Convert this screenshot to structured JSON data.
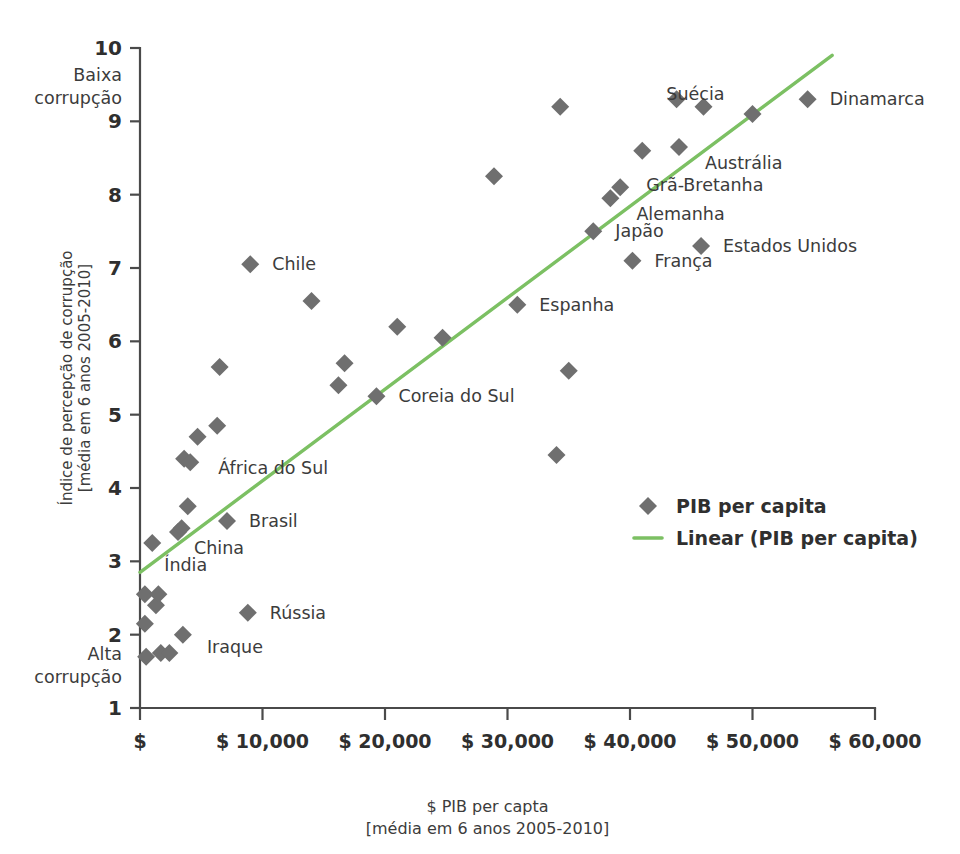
{
  "chart_data": {
    "type": "scatter",
    "title": "",
    "xlabel": "$ PIB per capta",
    "xlabel_sub": "[média em 6 anos 2005-2010]",
    "ylabel": "Índice de percepção de corrupção",
    "ylabel_sub": "[média em 6 anos 2005-2010]",
    "xlim": [
      0,
      60000
    ],
    "ylim": [
      1,
      10
    ],
    "grid": false,
    "legend_position": "middle-right",
    "xticks": [
      0,
      10000,
      20000,
      30000,
      40000,
      50000,
      60000
    ],
    "xtick_labels": [
      "$",
      "$ 10,000",
      "$ 20,000",
      "$ 30,000",
      "$ 40,000",
      "$ 50,000",
      "$ 60,000"
    ],
    "yticks": [
      1,
      2,
      3,
      4,
      5,
      6,
      7,
      8,
      9,
      10
    ],
    "ytick_labels": [
      "1",
      "2",
      "3",
      "4",
      "5",
      "6",
      "7",
      "8",
      "9",
      "10"
    ],
    "y_axis_top_note": "Baixa\ncorrupção",
    "y_axis_top_note_line1": "Baixa",
    "y_axis_top_note_line2": "corrupção",
    "y_axis_bottom_note_line1": "Alta",
    "y_axis_bottom_note_line2": "corrupção",
    "marker_color": "#6f6f6f",
    "line_color": "#7cc063",
    "axis_color": "#4a4a4a",
    "series": [
      {
        "name": "PIB per capita",
        "type": "scatter",
        "marker": "diamond",
        "color": "#6f6f6f",
        "points": [
          {
            "x": 400,
            "y": 2.55,
            "label": ""
          },
          {
            "x": 400,
            "y": 2.15,
            "label": ""
          },
          {
            "x": 500,
            "y": 1.7,
            "label": ""
          },
          {
            "x": 1000,
            "y": 3.25,
            "label": "Índia"
          },
          {
            "x": 1300,
            "y": 2.4,
            "label": ""
          },
          {
            "x": 1500,
            "y": 2.55,
            "label": ""
          },
          {
            "x": 1700,
            "y": 1.75,
            "label": ""
          },
          {
            "x": 2400,
            "y": 1.75,
            "label": ""
          },
          {
            "x": 3100,
            "y": 3.4,
            "label": "China"
          },
          {
            "x": 3400,
            "y": 3.45,
            "label": ""
          },
          {
            "x": 3500,
            "y": 2.0,
            "label": "Iraque"
          },
          {
            "x": 3600,
            "y": 4.4,
            "label": ""
          },
          {
            "x": 3900,
            "y": 3.75,
            "label": ""
          },
          {
            "x": 4100,
            "y": 4.35,
            "label": "África do Sul"
          },
          {
            "x": 4700,
            "y": 4.7,
            "label": ""
          },
          {
            "x": 6300,
            "y": 4.85,
            "label": ""
          },
          {
            "x": 6500,
            "y": 5.65,
            "label": ""
          },
          {
            "x": 7100,
            "y": 3.55,
            "label": "Brasil"
          },
          {
            "x": 8800,
            "y": 2.3,
            "label": "Rússia"
          },
          {
            "x": 9000,
            "y": 7.05,
            "label": "Chile"
          },
          {
            "x": 14000,
            "y": 6.55,
            "label": ""
          },
          {
            "x": 16200,
            "y": 5.4,
            "label": ""
          },
          {
            "x": 16700,
            "y": 5.7,
            "label": ""
          },
          {
            "x": 19300,
            "y": 5.25,
            "label": "Coreia do Sul"
          },
          {
            "x": 21000,
            "y": 6.2,
            "label": ""
          },
          {
            "x": 24700,
            "y": 6.05,
            "label": ""
          },
          {
            "x": 28900,
            "y": 8.25,
            "label": ""
          },
          {
            "x": 30800,
            "y": 6.5,
            "label": "Espanha"
          },
          {
            "x": 34000,
            "y": 4.45,
            "label": ""
          },
          {
            "x": 34300,
            "y": 9.2,
            "label": ""
          },
          {
            "x": 35000,
            "y": 5.6,
            "label": ""
          },
          {
            "x": 37000,
            "y": 7.5,
            "label": "Japão"
          },
          {
            "x": 38400,
            "y": 7.95,
            "label": "Alemanha"
          },
          {
            "x": 39200,
            "y": 8.1,
            "label": "Grã-Bretanha"
          },
          {
            "x": 40200,
            "y": 7.1,
            "label": "França"
          },
          {
            "x": 41000,
            "y": 8.6,
            "label": ""
          },
          {
            "x": 43800,
            "y": 9.3,
            "label": ""
          },
          {
            "x": 44000,
            "y": 8.65,
            "label": "Austrália"
          },
          {
            "x": 45800,
            "y": 7.3,
            "label": "Estados Unidos"
          },
          {
            "x": 46000,
            "y": 9.2,
            "label": ""
          },
          {
            "x": 50000,
            "y": 9.1,
            "label": "Suécia"
          },
          {
            "x": 54500,
            "y": 9.3,
            "label": "Dinamarca"
          }
        ]
      },
      {
        "name": "Linear (PIB per capita)",
        "type": "line",
        "color": "#7cc063",
        "x_start": 0,
        "y_start": 2.85,
        "x_end": 56500,
        "y_end": 9.9
      }
    ],
    "annotations": [
      {
        "text": "Chile",
        "x": 9000,
        "y": 7.05,
        "dx": 22,
        "dy": 6
      },
      {
        "text": "Coreia do Sul",
        "x": 19300,
        "y": 5.25,
        "dx": 22,
        "dy": 6
      },
      {
        "text": "Espanha",
        "x": 30800,
        "y": 6.5,
        "dx": 22,
        "dy": 6
      },
      {
        "text": "África do Sul",
        "x": 4100,
        "y": 4.35,
        "dx": 28,
        "dy": 12
      },
      {
        "text": "Brasil",
        "x": 7100,
        "y": 3.55,
        "dx": 22,
        "dy": 6
      },
      {
        "text": "China",
        "x": 3100,
        "y": 3.4,
        "dx": 16,
        "dy": 22
      },
      {
        "text": "Índia",
        "x": 1000,
        "y": 3.25,
        "dx": 12,
        "dy": 28
      },
      {
        "text": "Rússia",
        "x": 8800,
        "y": 2.3,
        "dx": 22,
        "dy": 6
      },
      {
        "text": "Iraque",
        "x": 3500,
        "y": 2.0,
        "dx": 24,
        "dy": 18
      },
      {
        "text": "Japão",
        "x": 37000,
        "y": 7.5,
        "dx": 22,
        "dy": 6
      },
      {
        "text": "França",
        "x": 40200,
        "y": 7.1,
        "dx": 22,
        "dy": 6
      },
      {
        "text": "Alemanha",
        "x": 38400,
        "y": 7.95,
        "dx": 26,
        "dy": 22
      },
      {
        "text": "Grã-Bretanha",
        "x": 39200,
        "y": 8.1,
        "dx": 26,
        "dy": 4
      },
      {
        "text": "Estados Unidos",
        "x": 45800,
        "y": 7.3,
        "dx": 22,
        "dy": 6
      },
      {
        "text": "Austrália",
        "x": 44000,
        "y": 8.65,
        "dx": 26,
        "dy": 22
      },
      {
        "text": "Suécia",
        "x": 50000,
        "y": 9.1,
        "dx": -28,
        "dy": -14
      },
      {
        "text": "Dinamarca",
        "x": 54500,
        "y": 9.3,
        "dx": 22,
        "dy": 6
      }
    ]
  },
  "legend": {
    "items": [
      {
        "label": "PIB per capita",
        "marker": "diamond",
        "color": "#6f6f6f"
      },
      {
        "label": "Linear (PIB per capita)",
        "marker": "line",
        "color": "#7cc063"
      }
    ]
  }
}
